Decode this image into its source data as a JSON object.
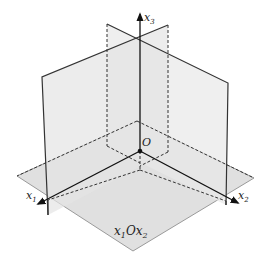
{
  "diagram": {
    "type": "coordinate-planes-3d",
    "axes": {
      "x1": {
        "label_main": "x",
        "label_sub": "1"
      },
      "x2": {
        "label_main": "x",
        "label_sub": "2"
      },
      "x3": {
        "label_main": "x",
        "label_sub": "3"
      }
    },
    "origin_label": "O",
    "plane_label": {
      "p1": "x",
      "s1": "1",
      "mid": "O",
      "p2": "x",
      "s2": "2"
    },
    "colors": {
      "floor": "#d4d4d4",
      "floor_edge": "#9a9a9a",
      "wall": "#e6e6e6",
      "wall_edge": "#333333",
      "axis": "#111111"
    }
  }
}
